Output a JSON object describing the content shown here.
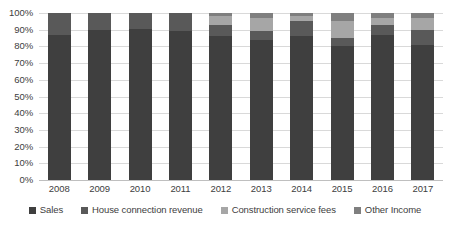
{
  "chart_data": {
    "type": "bar",
    "stacked": true,
    "stack_mode": "percent",
    "title": "",
    "xlabel": "",
    "ylabel": "",
    "categories": [
      "2008",
      "2009",
      "2010",
      "2011",
      "2012",
      "2013",
      "2014",
      "2015",
      "2016",
      "2017"
    ],
    "ylim": [
      0,
      100
    ],
    "ytick_labels": [
      "100%",
      "90%",
      "80%",
      "70%",
      "60%",
      "50%",
      "40%",
      "30%",
      "20%",
      "10%",
      "0%"
    ],
    "ytick_values": [
      100,
      90,
      80,
      70,
      60,
      50,
      40,
      30,
      20,
      10,
      0
    ],
    "grid": true,
    "legend_position": "bottom",
    "series": [
      {
        "name": "Sales",
        "color": "#3f3f3f",
        "values": [
          87,
          90,
          90.5,
          89,
          86,
          84,
          86,
          80,
          87,
          81
        ]
      },
      {
        "name": "House connection revenue",
        "color": "#595959",
        "values": [
          13,
          10,
          9.5,
          11,
          7,
          5,
          9,
          5,
          6,
          9
        ]
      },
      {
        "name": "Construction service fees",
        "color": "#a6a6a6",
        "values": [
          0,
          0,
          0,
          0,
          5,
          8,
          3,
          10,
          4,
          7
        ]
      },
      {
        "name": "Other Income",
        "color": "#7f7f7f",
        "values": [
          0,
          0,
          0,
          0,
          2,
          3,
          2,
          5,
          3,
          3
        ]
      }
    ]
  },
  "colors": {
    "gridline": "#d9d9d9",
    "baseline": "#bfbfbf",
    "text": "#404040",
    "background": "#ffffff"
  }
}
